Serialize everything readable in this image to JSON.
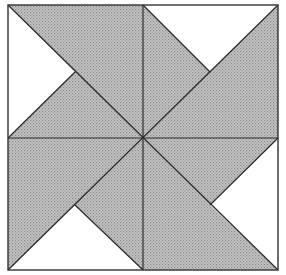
{
  "diagram": {
    "colors": {
      "shaded_fill": "#bdbdbd",
      "dot": "#8a8a8a",
      "blank_fill": "#ffffff",
      "line": "#333333"
    },
    "quadrants": [
      {
        "name": "top-left",
        "white_triangle": "left"
      },
      {
        "name": "top-right",
        "white_triangle": "top"
      },
      {
        "name": "bottom-left",
        "white_triangle": "bottom"
      },
      {
        "name": "bottom-right",
        "white_triangle": "right"
      }
    ]
  }
}
